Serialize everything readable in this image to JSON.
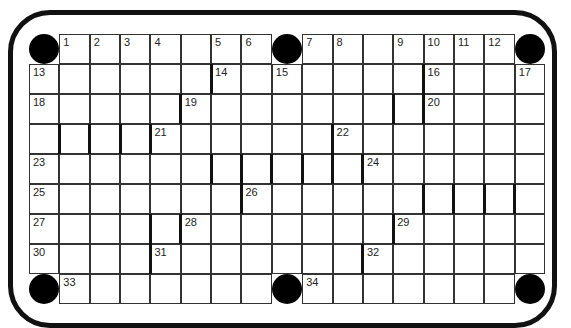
{
  "puzzle": {
    "type": "crossword",
    "rows": 9,
    "cols": 17,
    "colors": {
      "border": "#111111",
      "cell_bg": "#ffffff",
      "grid_line": "#333333"
    },
    "circles": [
      [
        0,
        0
      ],
      [
        0,
        8
      ],
      [
        0,
        16
      ],
      [
        8,
        0
      ],
      [
        8,
        8
      ],
      [
        8,
        16
      ]
    ],
    "numbers": [
      {
        "r": 0,
        "c": 1,
        "n": "1"
      },
      {
        "r": 0,
        "c": 2,
        "n": "2"
      },
      {
        "r": 0,
        "c": 3,
        "n": "3"
      },
      {
        "r": 0,
        "c": 4,
        "n": "4"
      },
      {
        "r": 0,
        "c": 6,
        "n": "5"
      },
      {
        "r": 0,
        "c": 7,
        "n": "6"
      },
      {
        "r": 0,
        "c": 9,
        "n": "7"
      },
      {
        "r": 0,
        "c": 10,
        "n": "8"
      },
      {
        "r": 0,
        "c": 12,
        "n": "9"
      },
      {
        "r": 0,
        "c": 13,
        "n": "10"
      },
      {
        "r": 0,
        "c": 14,
        "n": "11"
      },
      {
        "r": 0,
        "c": 15,
        "n": "12"
      },
      {
        "r": 1,
        "c": 0,
        "n": "13"
      },
      {
        "r": 1,
        "c": 6,
        "n": "14"
      },
      {
        "r": 1,
        "c": 8,
        "n": "15"
      },
      {
        "r": 1,
        "c": 13,
        "n": "16"
      },
      {
        "r": 1,
        "c": 16,
        "n": "17"
      },
      {
        "r": 2,
        "c": 0,
        "n": "18"
      },
      {
        "r": 2,
        "c": 5,
        "n": "19"
      },
      {
        "r": 2,
        "c": 13,
        "n": "20"
      },
      {
        "r": 3,
        "c": 4,
        "n": "21"
      },
      {
        "r": 3,
        "c": 10,
        "n": "22"
      },
      {
        "r": 4,
        "c": 0,
        "n": "23"
      },
      {
        "r": 4,
        "c": 11,
        "n": "24"
      },
      {
        "r": 5,
        "c": 0,
        "n": "25"
      },
      {
        "r": 5,
        "c": 7,
        "n": "26"
      },
      {
        "r": 6,
        "c": 0,
        "n": "27"
      },
      {
        "r": 6,
        "c": 5,
        "n": "28"
      },
      {
        "r": 6,
        "c": 12,
        "n": "29"
      },
      {
        "r": 7,
        "c": 0,
        "n": "30"
      },
      {
        "r": 7,
        "c": 4,
        "n": "31"
      },
      {
        "r": 7,
        "c": 11,
        "n": "32"
      },
      {
        "r": 8,
        "c": 1,
        "n": "33"
      },
      {
        "r": 8,
        "c": 9,
        "n": "34"
      }
    ],
    "bars": [
      {
        "r": 1,
        "b": 6
      },
      {
        "r": 1,
        "b": 13
      },
      {
        "r": 2,
        "b": 5
      },
      {
        "r": 2,
        "b": 12
      },
      {
        "r": 2,
        "b": 13
      },
      {
        "r": 3,
        "b": 1
      },
      {
        "r": 3,
        "b": 2
      },
      {
        "r": 3,
        "b": 3
      },
      {
        "r": 3,
        "b": 4
      },
      {
        "r": 3,
        "b": 10
      },
      {
        "r": 4,
        "b": 6
      },
      {
        "r": 4,
        "b": 7
      },
      {
        "r": 4,
        "b": 8
      },
      {
        "r": 4,
        "b": 9
      },
      {
        "r": 4,
        "b": 10
      },
      {
        "r": 4,
        "b": 11
      },
      {
        "r": 5,
        "b": 7
      },
      {
        "r": 5,
        "b": 13
      },
      {
        "r": 5,
        "b": 14
      },
      {
        "r": 5,
        "b": 15
      },
      {
        "r": 5,
        "b": 16
      },
      {
        "r": 6,
        "b": 4
      },
      {
        "r": 6,
        "b": 5
      },
      {
        "r": 6,
        "b": 12
      },
      {
        "r": 7,
        "b": 4
      },
      {
        "r": 7,
        "b": 11
      }
    ]
  }
}
